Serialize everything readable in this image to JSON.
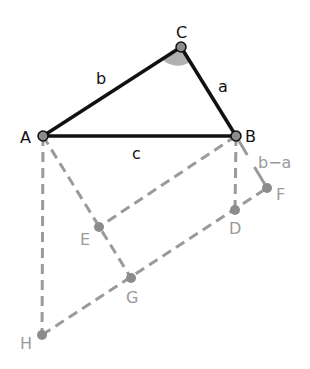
{
  "diagram": {
    "colors": {
      "solid_edge": "#111111",
      "dashed_edge": "#9a9a9a",
      "point_fill": "#8c8c8c",
      "angle_fill": "#b0b0b0"
    },
    "points": {
      "A": {
        "label": "A",
        "x": 43,
        "y": 136
      },
      "B": {
        "label": "B",
        "x": 236,
        "y": 136
      },
      "C": {
        "label": "C",
        "x": 181,
        "y": 47
      },
      "D": {
        "label": "D",
        "x": 235,
        "y": 210
      },
      "E": {
        "label": "E",
        "x": 99,
        "y": 227
      },
      "F": {
        "label": "F",
        "x": 267,
        "y": 188
      },
      "G": {
        "label": "G",
        "x": 131,
        "y": 278
      },
      "H": {
        "label": "H",
        "x": 42,
        "y": 335
      }
    },
    "side_labels": {
      "a": "a",
      "b": "b",
      "c": "c",
      "b_minus_a": "b−a"
    },
    "solid_edges": [
      [
        "A",
        "B"
      ],
      [
        "B",
        "C"
      ],
      [
        "C",
        "A"
      ]
    ],
    "dashed_edges": [
      [
        "A",
        "H"
      ],
      [
        "A",
        "G"
      ],
      [
        "B",
        "E"
      ],
      [
        "B",
        "D"
      ],
      [
        "B",
        "F"
      ],
      [
        "H",
        "F"
      ]
    ],
    "angle_marker": "C"
  }
}
